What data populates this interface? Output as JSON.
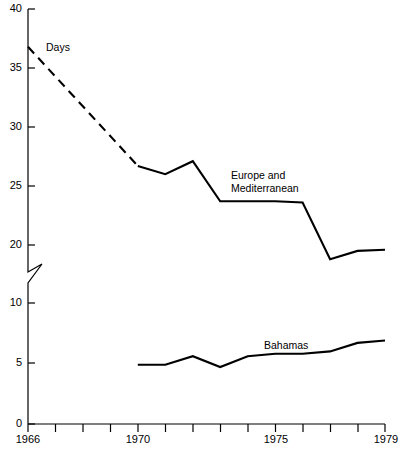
{
  "chart_data": {
    "type": "line",
    "title": "",
    "xlabel": "",
    "ylabel": "Days",
    "unit_label": "Days",
    "xlim": [
      1966,
      1979
    ],
    "ylim": [
      0,
      40
    ],
    "y_axis_broken": true,
    "y_break_between": [
      10,
      20
    ],
    "grid": false,
    "legend": "inline-annotations",
    "y_ticks": [
      0,
      5,
      10,
      20,
      25,
      30,
      35,
      40
    ],
    "y_tick_labels": [
      "0",
      "5",
      "10",
      "20",
      "25",
      "30",
      "35",
      "40"
    ],
    "x_ticks": [
      1966,
      1967,
      1968,
      1969,
      1970,
      1971,
      1972,
      1973,
      1974,
      1975,
      1976,
      1977,
      1978,
      1979
    ],
    "x_tick_labels_shown": [
      "1966",
      "1970",
      "1975",
      "1979"
    ],
    "x": [
      1966,
      1967,
      1968,
      1969,
      1970,
      1971,
      1972,
      1973,
      1974,
      1975,
      1976,
      1977,
      1978,
      1979
    ],
    "series": [
      {
        "name": "Europe and Mediterranean",
        "label_line1": "Europe and",
        "label_line2": "Mediterranean",
        "color": "#000000",
        "x": [
          1966,
          1970,
          1971,
          1972,
          1973,
          1974,
          1975,
          1976,
          1977,
          1978,
          1979
        ],
        "values": [
          36.8,
          26.7,
          26.0,
          27.1,
          23.7,
          23.7,
          23.7,
          23.6,
          18.8,
          19.5,
          19.6
        ],
        "dashed_from": 1966,
        "dashed_to": 1970
      },
      {
        "name": "Bahamas",
        "label_line1": "Bahamas",
        "label_line2": "",
        "color": "#000000",
        "x": [
          1970,
          1971,
          1972,
          1973,
          1974,
          1975,
          1976,
          1977,
          1978,
          1979
        ],
        "values": [
          4.9,
          4.9,
          5.6,
          4.7,
          5.6,
          5.8,
          5.8,
          6.0,
          6.7,
          6.9
        ],
        "dashed_from": null,
        "dashed_to": null
      }
    ],
    "annotations": [
      {
        "text": "Days",
        "x": 1967.2,
        "y": 36.2
      },
      {
        "text": "Europe and",
        "x": 1973.2,
        "y": 25.6
      },
      {
        "text": "Mediterranean",
        "x": 1973.2,
        "y": 24.6
      },
      {
        "text": "Bahamas",
        "x": 1974.6,
        "y": 7.2
      }
    ]
  }
}
